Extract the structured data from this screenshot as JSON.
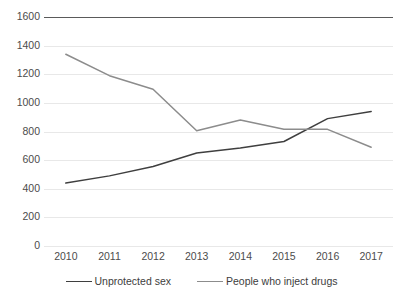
{
  "chart_data": {
    "type": "line",
    "title": "",
    "subtitle": "",
    "xlabel": "",
    "ylabel": "",
    "categories": [
      "2010",
      "2011",
      "2012",
      "2013",
      "2014",
      "2015",
      "2016",
      "2017"
    ],
    "x": [
      2010,
      2011,
      2012,
      2013,
      2014,
      2015,
      2016,
      2017
    ],
    "series": [
      {
        "name": "Unprotected sex",
        "color": "#3f3f3f",
        "values": [
          440,
          490,
          555,
          650,
          685,
          730,
          890,
          940
        ]
      },
      {
        "name": "People who inject drugs",
        "color": "#8c8c8c",
        "values": [
          1340,
          1190,
          1095,
          805,
          880,
          815,
          815,
          690
        ]
      }
    ],
    "ylim": [
      0,
      1600
    ],
    "yticks": [
      0,
      200,
      400,
      600,
      800,
      1000,
      1200,
      1400,
      1600
    ],
    "ytick_labels": [
      "0",
      "200",
      "400",
      "600",
      "800",
      "1000",
      "1200",
      "1400",
      "1600"
    ],
    "xtick_labels": [
      "2010",
      "2011",
      "2012",
      "2013",
      "2014",
      "2015",
      "2016",
      "2017"
    ],
    "grid": true,
    "grid_axis": "y",
    "legend_position": "bottom",
    "legend_entries": [
      "Unprotected sex",
      "People who inject drugs"
    ],
    "annotations": []
  },
  "style": {
    "background": "#ffffff",
    "gridline_color": "#e8e8e8",
    "top_rule_color": "#5a5a5a",
    "tick_label_color": "#4c4c4c"
  }
}
